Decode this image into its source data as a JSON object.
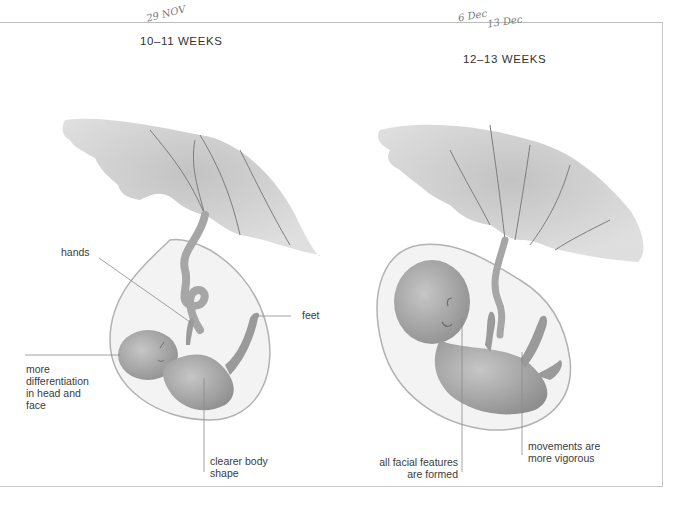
{
  "panels": [
    {
      "title": "10–11 WEEKS",
      "handwritten_note": "29 NOV",
      "labels": {
        "hands": "hands",
        "feet": "feet",
        "head_face": [
          "more",
          "differentiation",
          "in head and",
          "face"
        ],
        "body": [
          "clearer body",
          "shape"
        ]
      }
    },
    {
      "title": "12–13 WEEKS",
      "handwritten_note": [
        "6 Dec",
        "13 Dec"
      ],
      "labels": {
        "facial": [
          "all facial features",
          "are formed"
        ],
        "movements": [
          "movements are",
          "more vigorous"
        ]
      }
    }
  ],
  "colors": {
    "ink": "#3a3a3a",
    "frame": "#c4c4c4",
    "illustration": "#9a9a9a"
  }
}
